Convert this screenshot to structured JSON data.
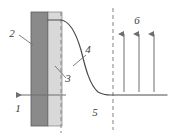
{
  "figure": {
    "type": "technical-schematic",
    "title": "",
    "width": 169,
    "height": 136,
    "background_color": "#ffffff"
  },
  "colors": {
    "dark_layer": "#8a8a8a",
    "light_layer": "#d9d9d9",
    "layer_outline": "#5a5a5a",
    "curve": "#4a4a4a",
    "dashed_line": "#8e8e8e",
    "arrow": "#6e6e6e",
    "label_text": "#3a3a3a"
  },
  "layers": {
    "dark": {
      "x": 31,
      "y": 12,
      "width": 17,
      "height": 114,
      "fill": "#8a8a8a"
    },
    "light": {
      "x": 48,
      "y": 12,
      "width": 14,
      "height": 114,
      "fill": "#d9d9d9"
    }
  },
  "dashed_lines": [
    {
      "name": "interface-dashed-line",
      "x": 61,
      "y_top": 12,
      "y_bottom": 133
    },
    {
      "name": "right-dashed-line",
      "x": 113,
      "y_top": 8,
      "y_bottom": 130
    }
  ],
  "curve": {
    "name": "concentration-profile-curve",
    "start": {
      "x": 48,
      "y": 20
    },
    "plateau_y": 95,
    "end_x": 167,
    "shape": "exponential-decay"
  },
  "flow_arrow": {
    "name": "inflow-arrow",
    "direction": "left",
    "y": 95,
    "tail_x": 66,
    "head_x": 14
  },
  "up_arrows": {
    "count": 3,
    "direction": "up",
    "xs": [
      124,
      139,
      154
    ],
    "tail_y": 92,
    "head_y": 32
  },
  "labels": [
    {
      "id": "label-1",
      "text": "1",
      "x": 18,
      "y": 112,
      "leader": null
    },
    {
      "id": "label-2",
      "text": "2",
      "x": 12,
      "y": 37,
      "leader": {
        "x1": 19,
        "y1": 35,
        "x2": 33,
        "y2": 45
      }
    },
    {
      "id": "label-3",
      "text": "3",
      "x": 68,
      "y": 82,
      "leader": {
        "x1": 66,
        "y1": 78,
        "x2": 55,
        "y2": 66
      }
    },
    {
      "id": "label-4",
      "text": "4",
      "x": 88,
      "y": 53,
      "leader": {
        "x1": 86,
        "y1": 55,
        "x2": 73,
        "y2": 66
      }
    },
    {
      "id": "label-5",
      "text": "5",
      "x": 95,
      "y": 116,
      "leader": null
    },
    {
      "id": "label-6",
      "text": "6",
      "x": 137,
      "y": 24,
      "leader": null
    }
  ]
}
